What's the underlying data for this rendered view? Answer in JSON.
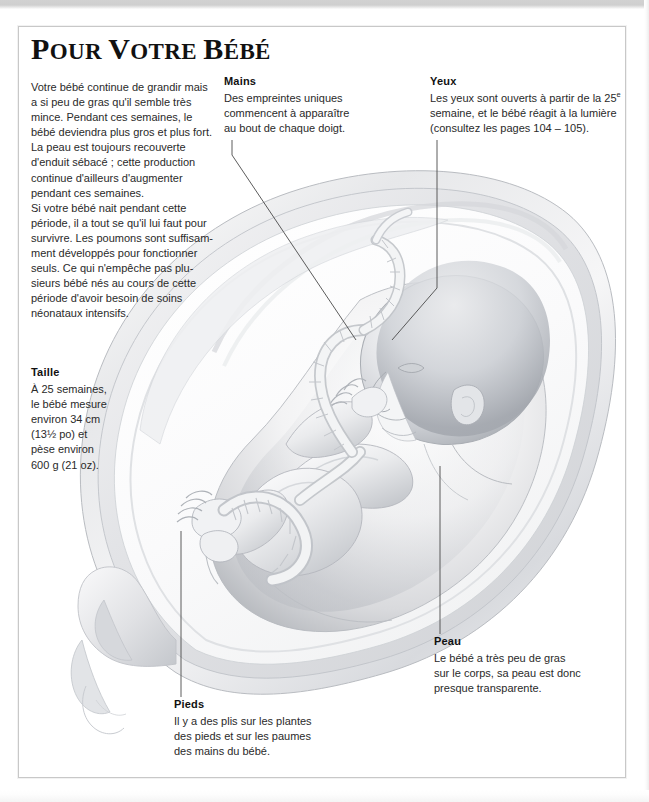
{
  "page": {
    "title_first_letter": "P",
    "title_rest_1": "OUR ",
    "title_v": "V",
    "title_rest_2": "OTRE ",
    "title_b": "B",
    "title_rest_3": "ÉBÉ",
    "title_full": "POUR VOTRE BÉBÉ"
  },
  "intro": {
    "lines": [
      "Votre bébé continue de grandir mais",
      "a si peu de gras qu'il semble très",
      "mince. Pendant ces semaines, le",
      "bébé deviendra plus gros et plus fort.",
      "La peau est toujours recouverte",
      "d'enduit sébacé ; cette production",
      "continue d'ailleurs d'augmenter",
      "pendant ces semaines.",
      "Si votre bébé nait pendant cette",
      "période, il a tout se qu'il lui faut pour",
      "survivre. Les poumons sont suffisam-",
      "ment développés pour fonctionner",
      "seuls. Ce qui n'empêche pas plu-",
      "sieurs bébé nés au cours de cette",
      "période d'avoir besoin de soins",
      "néonataux intensifs."
    ]
  },
  "callouts": {
    "mains": {
      "label": "Mains",
      "lines": [
        "Des empreintes uniques",
        "commencent à apparaître",
        "au bout de chaque doigt."
      ]
    },
    "yeux": {
      "label": "Yeux",
      "line1_a": "Les yeux sont ouverts à partir de la 25",
      "line1_sup": "e",
      "lines_rest": [
        "semaine, et le bébé réagit à la lumière",
        "(consultez les pages 104 – 105)."
      ]
    },
    "taille": {
      "label": "Taille",
      "lines": [
        "À 25 semaines,",
        "le bébé mesure",
        "environ 34 cm",
        "(13½ po) et",
        "pèse environ",
        "600 g (21 oz)."
      ]
    },
    "peau": {
      "label": "Peau",
      "lines": [
        "Le bébé a très peu de gras",
        "sur le corps, sa peau est donc",
        "presque transparente."
      ]
    },
    "pieds": {
      "label": "Pieds",
      "lines": [
        "Il y a des plis sur les plantes",
        "des pieds et sur les paumes",
        "des mains du bébé."
      ]
    }
  },
  "illustration": {
    "name": "fetus-in-uterus-25-weeks",
    "description": "Grayscale medical illustration of a 25-week fetus curled head-down inside the uterus with umbilical cord and placenta",
    "leader_line_color": "#4a4a4a"
  },
  "colors": {
    "text": "#2a2a2a",
    "label": "#111111",
    "frame": "#c8c8c8",
    "page_background": "#ffffff",
    "illustration_ink": "#9aa0a6"
  }
}
